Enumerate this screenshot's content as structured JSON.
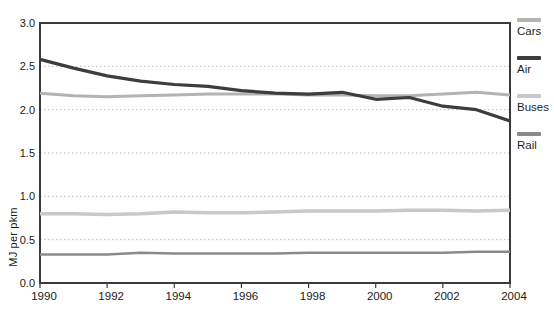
{
  "chart_data": {
    "type": "line",
    "title": "",
    "xlabel": "",
    "ylabel": "MJ per pkm",
    "x": [
      1990,
      1991,
      1992,
      1993,
      1994,
      1995,
      1996,
      1997,
      1998,
      1999,
      2000,
      2001,
      2002,
      2003,
      2004
    ],
    "x_tick_labels": [
      "1990",
      "1992",
      "1994",
      "1996",
      "1998",
      "2000",
      "2002",
      "2004"
    ],
    "x_ticks": [
      1990,
      1992,
      1994,
      1996,
      1998,
      2000,
      2002,
      2004
    ],
    "y_ticks": [
      0.0,
      0.5,
      1.0,
      1.5,
      2.0,
      2.5,
      3.0
    ],
    "y_tick_labels": [
      "0.0",
      "0.5",
      "1.0",
      "1.5",
      "2.0",
      "2.5",
      "3.0"
    ],
    "xlim": [
      1990,
      2004
    ],
    "ylim": [
      0.0,
      3.0
    ],
    "grid": "horizontal dotted gridlines at 0.5 intervals",
    "legend_position": "right",
    "series": [
      {
        "name": "Cars",
        "color": "#b3b3b3",
        "stroke_width": 3.0,
        "values": [
          2.19,
          2.16,
          2.15,
          2.16,
          2.17,
          2.18,
          2.18,
          2.18,
          2.17,
          2.17,
          2.16,
          2.16,
          2.18,
          2.2,
          2.17
        ]
      },
      {
        "name": "Air",
        "color": "#3d3d3d",
        "stroke_width": 3.2,
        "values": [
          2.58,
          2.48,
          2.39,
          2.33,
          2.29,
          2.27,
          2.22,
          2.19,
          2.18,
          2.2,
          2.12,
          2.14,
          2.04,
          2.0,
          1.87
        ]
      },
      {
        "name": "Buses",
        "color": "#c9c9c9",
        "stroke_width": 3.5,
        "values": [
          0.8,
          0.8,
          0.79,
          0.8,
          0.82,
          0.81,
          0.81,
          0.82,
          0.83,
          0.83,
          0.83,
          0.84,
          0.84,
          0.83,
          0.84
        ]
      },
      {
        "name": "Rail",
        "color": "#8a8a8a",
        "stroke_width": 2.5,
        "values": [
          0.33,
          0.33,
          0.33,
          0.35,
          0.34,
          0.34,
          0.34,
          0.34,
          0.35,
          0.35,
          0.35,
          0.35,
          0.35,
          0.36,
          0.36
        ]
      }
    ]
  },
  "styles": {
    "background": "#ffffff",
    "plot_border_color": "#3a3a3a",
    "grid_color": "#bbbbbb",
    "tick_color": "#3a3a3a",
    "text_color": "#1a1a1a"
  },
  "layout_px": {
    "plot_left": 40,
    "plot_top": 23,
    "plot_right": 510,
    "plot_bottom": 283,
    "legend_item_tops": [
      18,
      56,
      94,
      132
    ]
  }
}
